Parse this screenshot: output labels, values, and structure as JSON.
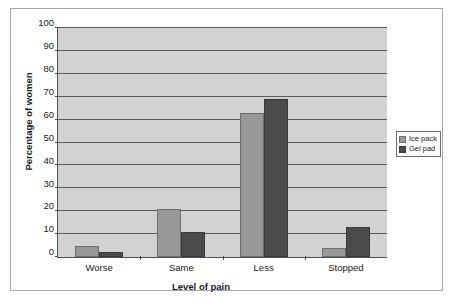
{
  "chart_data": {
    "type": "bar",
    "title": "",
    "xlabel": "Level of pain",
    "ylabel": "Percentage of women",
    "categories": [
      "Worse",
      "Same",
      "Less",
      "Stopped"
    ],
    "series": [
      {
        "name": "Ice pack",
        "color": "#989898",
        "values": [
          5,
          21,
          63,
          4
        ]
      },
      {
        "name": "Gel pad",
        "color": "#4b4b4b",
        "values": [
          2,
          11,
          69,
          13
        ]
      }
    ],
    "ylim": [
      0,
      100
    ],
    "ytick_step": 10,
    "yticks": [
      0,
      10,
      20,
      30,
      40,
      50,
      60,
      70,
      80,
      90,
      100
    ],
    "ytick_labels": [
      "0",
      "10",
      "20",
      "30",
      "40",
      "50",
      "60",
      "70",
      "80",
      "90",
      "100"
    ],
    "grid": true,
    "grid_axis": "y",
    "legend_position": "right",
    "plot_background": "#d2d2d2",
    "figure_background": "#ffffff"
  }
}
